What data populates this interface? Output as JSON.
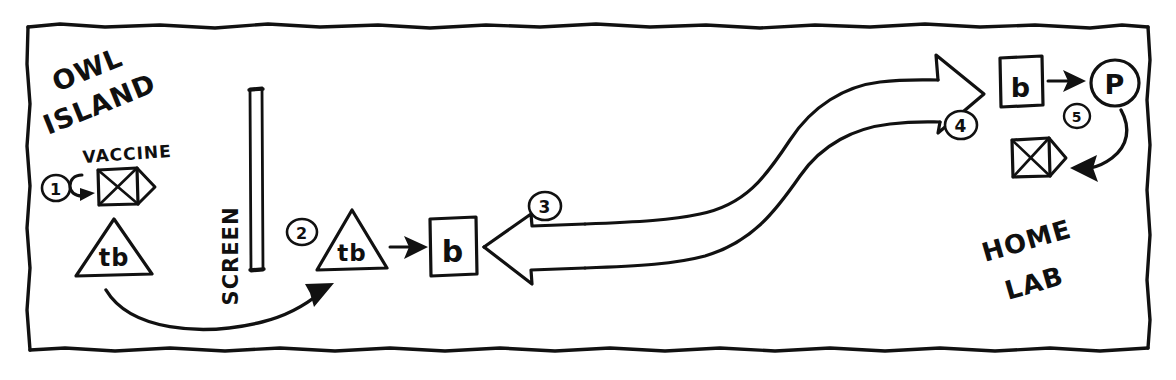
{
  "diagram": {
    "title_regions": {
      "left_region_line1": "OWL",
      "left_region_line2": "ISLAND",
      "right_region_line1": "HOME",
      "right_region_line2": "LAB",
      "barrier_label": "SCREEN"
    },
    "labels": {
      "vaccine": "VACCINE"
    },
    "steps": [
      {
        "number": "1",
        "name": "step-1-marker"
      },
      {
        "number": "2",
        "name": "step-2-marker"
      },
      {
        "number": "3",
        "name": "step-3-marker"
      },
      {
        "number": "4",
        "name": "step-4-marker"
      },
      {
        "number": "5",
        "name": "step-5-marker"
      }
    ],
    "nodes": {
      "vaccine_envelope_left": "",
      "triangle_left_label": "tb",
      "triangle_right_label": "tb",
      "box_b_center": "b",
      "box_b_right": "b",
      "circle_p": "P",
      "envelope_right": ""
    },
    "colors": {
      "ink": "#111111",
      "paper": "#ffffff"
    }
  }
}
